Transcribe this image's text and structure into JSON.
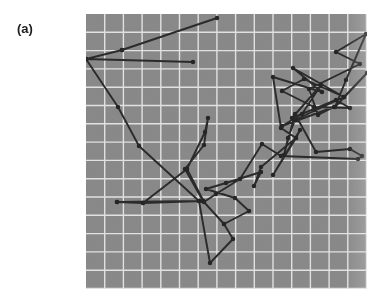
{
  "figure": {
    "panel_label": "(a)",
    "caption": "",
    "colors": {
      "panel_background": "#8b8b8b",
      "grid_line": "#e9e9e9",
      "trace": "#2b2b2b",
      "marker": "#262626",
      "page_background": "#ffffff",
      "label_text": "#1e1e1e"
    }
  },
  "chart_data": {
    "type": "line",
    "title": "(a)",
    "subtitle": "",
    "xlabel": "",
    "ylabel": "",
    "xlim": [
      0,
      281
    ],
    "ylim": [
      0,
      275
    ],
    "grid": true,
    "grid_spacing": 19,
    "grid_columns": 15,
    "grid_rows": 15,
    "legend": null,
    "legend_position": "none",
    "axis_ticks": [],
    "tick_labels": [],
    "annotations": [],
    "marker": "circle",
    "marker_size": 3,
    "series": [
      {
        "name": "trajectory",
        "points": [
          [
            107,
            48
          ],
          [
            0,
            45
          ],
          [
            36,
            36
          ],
          [
            131,
            4
          ],
          [
            36,
            36
          ],
          [
            0,
            45
          ],
          [
            32,
            93
          ],
          [
            53,
            132
          ],
          [
            113,
            187
          ],
          [
            31,
            188
          ],
          [
            57,
            189
          ],
          [
            117,
            187
          ],
          [
            101,
            155
          ],
          [
            119,
            118
          ],
          [
            122,
            104
          ],
          [
            118,
            131
          ],
          [
            99,
            155
          ],
          [
            117,
            187
          ],
          [
            138,
            210
          ],
          [
            163,
            197
          ],
          [
            149,
            184
          ],
          [
            120,
            175
          ],
          [
            140,
            169
          ],
          [
            175,
            158
          ],
          [
            168,
            172
          ],
          [
            175,
            153
          ],
          [
            210,
            124
          ],
          [
            214,
            116
          ],
          [
            187,
            161
          ],
          [
            210,
            124
          ],
          [
            195,
            114
          ],
          [
            187,
            63
          ],
          [
            236,
            78
          ],
          [
            207,
            54
          ],
          [
            258,
            83
          ],
          [
            218,
            65
          ],
          [
            196,
            77
          ],
          [
            228,
            93
          ],
          [
            264,
            94
          ],
          [
            250,
            86
          ],
          [
            206,
            104
          ],
          [
            235,
            71
          ],
          [
            216,
            100
          ],
          [
            196,
            112
          ],
          [
            248,
            93
          ],
          [
            232,
            101
          ],
          [
            223,
            75
          ],
          [
            274,
            50
          ],
          [
            250,
            38
          ],
          [
            280,
            20
          ],
          [
            260,
            66
          ],
          [
            249,
            93
          ],
          [
            281,
            59
          ],
          [
            258,
            83
          ],
          [
            209,
            106
          ],
          [
            202,
            124
          ],
          [
            198,
            141
          ],
          [
            209,
            100
          ],
          [
            230,
            138
          ],
          [
            264,
            135
          ],
          [
            276,
            142
          ],
          [
            272,
            145
          ],
          [
            195,
            142
          ],
          [
            176,
            130
          ],
          [
            154,
            165
          ],
          [
            130,
            180
          ],
          [
            118,
            188
          ],
          [
            101,
            155
          ],
          [
            57,
            189
          ],
          [
            31,
            188
          ],
          [
            117,
            187
          ],
          [
            138,
            210
          ],
          [
            147,
            225
          ],
          [
            124,
            249
          ],
          [
            113,
            187
          ]
        ],
        "n_points": 74
      }
    ]
  }
}
